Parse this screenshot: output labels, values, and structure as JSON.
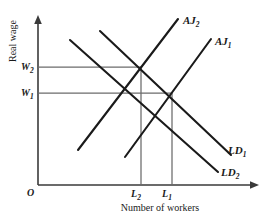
{
  "figure": {
    "type": "economics-labour-market-diagram",
    "background_color": "#ffffff",
    "curve_color": "#1a1a1a",
    "axis_color": "#3a3a3a",
    "guide_color": "#6b6b6b"
  },
  "axes": {
    "y_title": "Real wage",
    "x_title": "Number of workers",
    "origin_label": "O"
  },
  "y_ticks": [
    {
      "base": "W",
      "sub": "2",
      "y_px": 67
    },
    {
      "base": "W",
      "sub": "1",
      "y_px": 93
    }
  ],
  "x_ticks": [
    {
      "base": "L",
      "sub": "2",
      "x_px": 141
    },
    {
      "base": "L",
      "sub": "1",
      "x_px": 172
    }
  ],
  "curves": [
    {
      "name": "AJ2",
      "base": "AJ",
      "sub": "2",
      "slope": "upward",
      "label_x": 183,
      "label_y": 22
    },
    {
      "name": "AJ1",
      "base": "AJ",
      "sub": "1",
      "slope": "upward",
      "label_x": 215,
      "label_y": 43
    },
    {
      "name": "LD1",
      "base": "LD",
      "sub": "1",
      "slope": "downward",
      "label_x": 229,
      "label_y": 152
    },
    {
      "name": "LD2",
      "base": "LD",
      "sub": "2",
      "slope": "downward",
      "label_x": 222,
      "label_y": 174
    }
  ],
  "equilibria": [
    {
      "wage_label": "W2",
      "workers_label": "L2",
      "x_px": 141,
      "y_px": 67
    },
    {
      "wage_label": "W1",
      "workers_label": "L1",
      "x_px": 172,
      "y_px": 93
    }
  ]
}
